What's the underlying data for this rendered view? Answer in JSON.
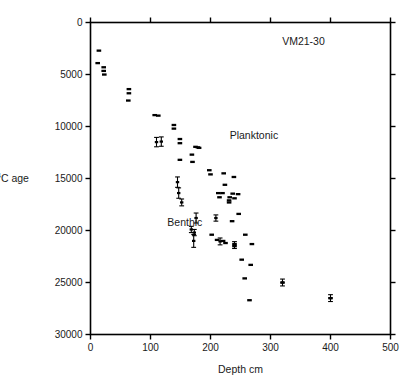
{
  "figure": {
    "core_label": "VM21-30",
    "series_label_planktonic": "Planktonic",
    "series_label_benthic": "Benthic"
  },
  "chart_data": {
    "type": "scatter",
    "title": "VM21-30",
    "xlabel": "Depth cm",
    "ylabel": "14C age",
    "ylabel_prefix_sup": "14",
    "ylabel_rest": "C age",
    "xlim": [
      0,
      500
    ],
    "ylim": [
      0,
      30000
    ],
    "y_inverted": true,
    "grid": false,
    "legend": "inline-annotations",
    "xticks": [
      0,
      100,
      200,
      300,
      400,
      500
    ],
    "xtick_labels": [
      "0",
      "100",
      "200",
      "300",
      "400",
      "500"
    ],
    "yticks": [
      0,
      5000,
      10000,
      15000,
      20000,
      25000,
      30000
    ],
    "ytick_labels": [
      "0",
      "5000",
      "10000",
      "15000",
      "20000",
      "25000",
      "30000"
    ],
    "annotations": [
      {
        "text": "VM21-30",
        "x": 355,
        "y": 2200
      },
      {
        "text": "Planktonic",
        "x": 232,
        "y": 11200
      },
      {
        "text": "Benthic",
        "x": 128,
        "y": 19600
      }
    ],
    "series": [
      {
        "name": "Planktonic",
        "marker": "filled-bar",
        "points": [
          {
            "x": 14,
            "y": 2700
          },
          {
            "x": 12,
            "y": 3900
          },
          {
            "x": 22,
            "y": 4300
          },
          {
            "x": 22,
            "y": 4650
          },
          {
            "x": 23,
            "y": 5000
          },
          {
            "x": 64,
            "y": 6400
          },
          {
            "x": 64,
            "y": 6800
          },
          {
            "x": 63,
            "y": 7500
          },
          {
            "x": 107,
            "y": 8900
          },
          {
            "x": 113,
            "y": 8950
          },
          {
            "x": 139,
            "y": 9850
          },
          {
            "x": 139,
            "y": 10200
          },
          {
            "x": 149,
            "y": 11200
          },
          {
            "x": 149,
            "y": 11600
          },
          {
            "x": 175,
            "y": 11950
          },
          {
            "x": 179,
            "y": 12000
          },
          {
            "x": 181,
            "y": 12050
          },
          {
            "x": 169,
            "y": 12700
          },
          {
            "x": 149,
            "y": 13200
          },
          {
            "x": 170,
            "y": 13400
          },
          {
            "x": 198,
            "y": 14200
          },
          {
            "x": 200,
            "y": 14600
          },
          {
            "x": 222,
            "y": 14500
          },
          {
            "x": 239,
            "y": 14850
          },
          {
            "x": 224,
            "y": 15600
          },
          {
            "x": 213,
            "y": 16400
          },
          {
            "x": 220,
            "y": 16400
          },
          {
            "x": 237,
            "y": 16450
          },
          {
            "x": 246,
            "y": 16500
          },
          {
            "x": 215,
            "y": 16800
          },
          {
            "x": 232,
            "y": 16800
          },
          {
            "x": 231,
            "y": 17100
          },
          {
            "x": 231,
            "y": 17300
          },
          {
            "x": 240,
            "y": 16900
          },
          {
            "x": 247,
            "y": 18400
          },
          {
            "x": 236,
            "y": 19100
          },
          {
            "x": 202,
            "y": 20400
          },
          {
            "x": 211,
            "y": 20900
          },
          {
            "x": 221,
            "y": 21000
          },
          {
            "x": 225,
            "y": 21200
          },
          {
            "x": 240,
            "y": 21300
          },
          {
            "x": 240,
            "y": 21500
          },
          {
            "x": 258,
            "y": 20400
          },
          {
            "x": 269,
            "y": 21300
          },
          {
            "x": 252,
            "y": 22800
          },
          {
            "x": 267,
            "y": 23300
          },
          {
            "x": 257,
            "y": 24600
          },
          {
            "x": 265,
            "y": 26700
          },
          {
            "x": 320,
            "y": 25000
          },
          {
            "x": 400,
            "y": 26500
          }
        ]
      },
      {
        "name": "Benthic",
        "marker": "errorbar",
        "points": [
          {
            "x": 110,
            "y": 11500,
            "yerr": 450
          },
          {
            "x": 118,
            "y": 11450,
            "yerr": 450
          },
          {
            "x": 145,
            "y": 15350,
            "yerr": 500
          },
          {
            "x": 147,
            "y": 16400,
            "yerr": 500
          },
          {
            "x": 152,
            "y": 17300,
            "yerr": 330
          },
          {
            "x": 176,
            "y": 18800,
            "yerr": 480
          },
          {
            "x": 168,
            "y": 19900,
            "yerr": 300
          },
          {
            "x": 173,
            "y": 20200,
            "yerr": 300
          },
          {
            "x": 172,
            "y": 21000,
            "yerr": 620
          },
          {
            "x": 216,
            "y": 21050,
            "yerr": 330
          },
          {
            "x": 209,
            "y": 18800,
            "yerr": 300
          },
          {
            "x": 240,
            "y": 21400,
            "yerr": 330
          },
          {
            "x": 320,
            "y": 25000,
            "yerr": 330
          },
          {
            "x": 400,
            "y": 26500,
            "yerr": 330
          }
        ]
      }
    ]
  }
}
